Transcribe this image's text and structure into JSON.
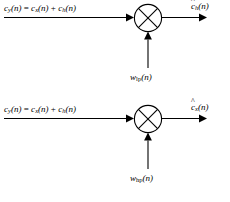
{
  "figure": {
    "type": "block-diagram",
    "background_color": "#ffffff",
    "line_color": "#000000"
  },
  "diagrams": [
    {
      "id": "lowpass-mixer",
      "input": {
        "signal": "c",
        "signal_subscript": "y",
        "argument": "(n)",
        "equals": "=",
        "term1": "c",
        "term1_subscript": "x",
        "term1_argument": "(n)",
        "plus": "+",
        "term2": "c",
        "term2_subscript": "h",
        "term2_argument": "(n)",
        "full_text": "c_y(n) = c_x(n) + c_h(n)"
      },
      "operator": {
        "symbol": "multiplier",
        "glyph": "crossed-circle"
      },
      "carrier": {
        "signal": "w",
        "subscript": "lp",
        "argument": "(n)",
        "full_text": "w_lp(n)"
      },
      "output": {
        "signal": "c",
        "hat": true,
        "subscript": "h",
        "argument": "(n)",
        "full_text": "ĉ_h(n)"
      }
    },
    {
      "id": "highpass-mixer",
      "input": {
        "signal": "c",
        "signal_subscript": "y",
        "argument": "(n)",
        "equals": "=",
        "term1": "c",
        "term1_subscript": "x",
        "term1_argument": "(n)",
        "plus": "+",
        "term2": "c",
        "term2_subscript": "h",
        "term2_argument": "(n)",
        "full_text": "c_y(n) = c_x(n) + c_h(n)"
      },
      "operator": {
        "symbol": "multiplier",
        "glyph": "crossed-circle"
      },
      "carrier": {
        "signal": "w",
        "subscript": "hp",
        "argument": "(n)",
        "full_text": "w_hp(n)"
      },
      "output": {
        "signal": "c",
        "hat": true,
        "subscript": "x",
        "argument": "(n)",
        "full_text": "ĉ_x(n)"
      }
    }
  ]
}
